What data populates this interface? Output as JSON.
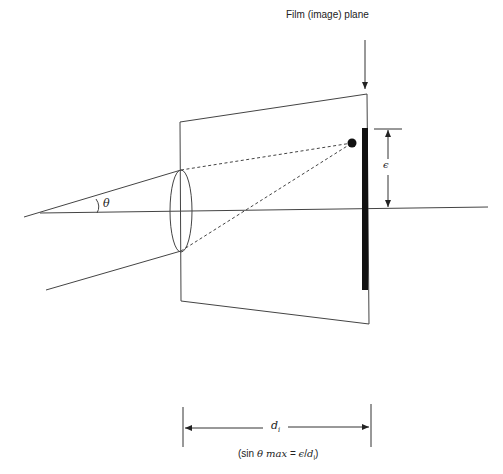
{
  "diagram": {
    "title_label": "Film (image) plane",
    "theta_label": "θ",
    "epsilon_label": "ϵ",
    "distance_label": "d",
    "distance_subscript": "i",
    "caption": {
      "prefix": "(sin ",
      "theta": "θ",
      "max": " max",
      "equals": " = ",
      "eps": "ϵ",
      "slash": "/",
      "d": "d",
      "sub": "i",
      "suffix": ")"
    }
  },
  "colors": {
    "line": "#333333",
    "film": "#111111",
    "background": "#ffffff"
  }
}
